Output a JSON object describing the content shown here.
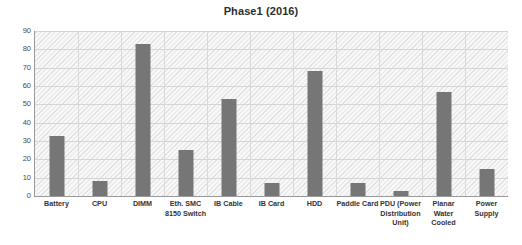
{
  "chart_data": {
    "type": "bar",
    "title": "Phase1 (2016)",
    "xlabel": "",
    "ylabel": "",
    "ylim": [
      0,
      90
    ],
    "ytick_step": 10,
    "yticks": [
      90,
      80,
      70,
      60,
      50,
      40,
      30,
      20,
      10,
      0
    ],
    "grid": "horizontal-and-vertical",
    "legend": "none",
    "bar_color": "#767676",
    "plot_background": "#f2f2f2",
    "categories": [
      "Battery",
      "CPU",
      "DIMM",
      "Eth. SMC 8150 Switch",
      "IB Cable",
      "IB Card",
      "HDD",
      "Paddle Card",
      "PDU (Power Distribution Unit)",
      "Planar Water Cooled",
      "Power Supply"
    ],
    "category_label_lines": [
      [
        "Battery"
      ],
      [
        "CPU"
      ],
      [
        "DIMM"
      ],
      [
        "Eth. SMC",
        "8150 Switch"
      ],
      [
        "IB Cable"
      ],
      [
        "IB Card"
      ],
      [
        "HDD"
      ],
      [
        "Paddle Card"
      ],
      [
        "PDU (Power",
        "Distribution",
        "Unit)"
      ],
      [
        "Planar Water",
        "Cooled"
      ],
      [
        "Power Supply"
      ]
    ],
    "values": [
      33,
      8,
      83,
      25,
      53,
      7,
      68,
      7,
      3,
      57,
      15
    ]
  }
}
